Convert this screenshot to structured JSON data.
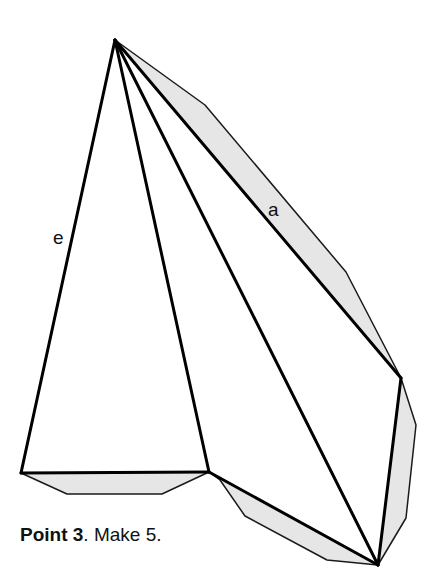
{
  "diagram": {
    "type": "folding-net",
    "apex": [
      115,
      40
    ],
    "vertices": {
      "bottom_left": [
        21,
        473
      ],
      "bottom_mid": [
        209,
        472
      ],
      "bottom_right": [
        378,
        565
      ],
      "right": [
        401,
        378
      ]
    },
    "edge_labels": [
      {
        "text": "a",
        "x": 268,
        "y": 216
      },
      {
        "text": "e",
        "x": 53,
        "y": 244
      }
    ],
    "glue_tab_color": "#e6e6e6",
    "line_color": "#000000"
  },
  "caption": {
    "bold": "Point 3",
    "rest": ". Make 5."
  }
}
